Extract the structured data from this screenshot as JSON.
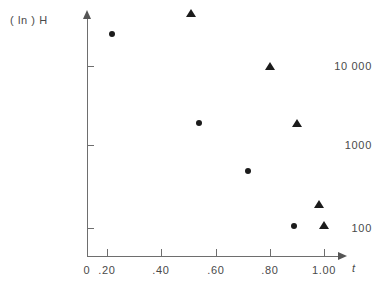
{
  "chart_data": {
    "type": "scatter",
    "title": "",
    "xlabel": "t",
    "ylabel": "( ln ) H",
    "yscale": "log",
    "xlim": [
      0.0,
      1.08
    ],
    "ylim": [
      70,
      60000
    ],
    "grid": false,
    "legend": "none",
    "xticks": [
      "0",
      ".20",
      ".40",
      ".60",
      ".80",
      "1.00"
    ],
    "xtick_values": [
      0.0,
      0.2,
      0.4,
      0.6,
      0.8,
      1.0
    ],
    "yticks": [
      "10 000",
      "1000",
      "100"
    ],
    "ytick_values": [
      10000,
      1000,
      100
    ],
    "series": [
      {
        "name": "circles",
        "marker": "circle",
        "color": "#1b1b1b",
        "points": [
          {
            "x": 0.22,
            "y": 25000
          },
          {
            "x": 0.54,
            "y": 2000
          },
          {
            "x": 0.72,
            "y": 500
          },
          {
            "x": 0.89,
            "y": 105
          }
        ]
      },
      {
        "name": "triangles",
        "marker": "triangle",
        "color": "#1b1b1b",
        "points": [
          {
            "x": 0.51,
            "y": 45000
          },
          {
            "x": 0.8,
            "y": 10000
          },
          {
            "x": 0.9,
            "y": 2000
          },
          {
            "x": 0.98,
            "y": 200
          },
          {
            "x": 1.0,
            "y": 110
          }
        ]
      }
    ]
  },
  "axes": {
    "y_title": "( ln ) H",
    "x_title": "t",
    "y_labels": [
      "10 000",
      "1000",
      "100"
    ],
    "x_labels": [
      "0",
      ".20",
      ".40",
      ".60",
      ".80",
      "1.00"
    ]
  }
}
